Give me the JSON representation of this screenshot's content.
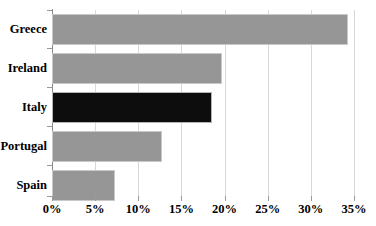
{
  "chart_data": {
    "type": "bar",
    "orientation": "horizontal",
    "title": "",
    "subtitle": "",
    "xlabel": "",
    "ylabel": "",
    "categories": [
      "Greece",
      "Ireland",
      "Italy",
      "Portugal",
      "Spain"
    ],
    "values": [
      34.3,
      19.7,
      18.5,
      12.8,
      7.3
    ],
    "value_format": "percent",
    "xlim": [
      0,
      35
    ],
    "xticks": [
      0,
      5,
      10,
      15,
      20,
      25,
      30,
      35
    ],
    "xticklabels": [
      "0%",
      "5%",
      "10%",
      "15%",
      "20%",
      "25%",
      "30%",
      "35%"
    ],
    "grid": true,
    "grid_axis": "x",
    "legend": false,
    "legend_position": "none",
    "highlight_category": "Italy",
    "series": [
      {
        "name": "share",
        "values": [
          34.3,
          19.7,
          18.5,
          12.8,
          7.3
        ]
      }
    ],
    "bar_colors": [
      "#969696",
      "#969696",
      "#0d0d0d",
      "#969696",
      "#969696"
    ]
  },
  "colors": {
    "bar_default": "#969696",
    "bar_highlight": "#0d0d0d",
    "gridline": "#d8d8d8",
    "axis": "#8a8a8a",
    "text": "#000000",
    "background": "#ffffff"
  }
}
